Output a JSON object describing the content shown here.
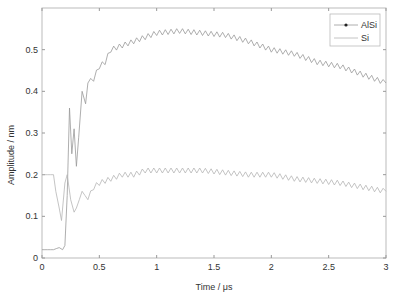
{
  "chart_data": {
    "type": "line",
    "title": "",
    "xlabel": "Time / μs",
    "ylabel": "Amplitude / nm",
    "xlim": [
      0,
      3
    ],
    "ylim": [
      0,
      0.6
    ],
    "xticks": [
      "0",
      "0.5",
      "1",
      "1.5",
      "2",
      "2.5",
      "3"
    ],
    "yticks": [
      "0",
      "0.1",
      "0.2",
      "0.3",
      "0.4",
      "0.5"
    ],
    "grid": false,
    "legend_position": "upper right",
    "series": [
      {
        "name": "AlSi",
        "marker": "dot",
        "x": [
          0,
          0.05,
          0.1,
          0.15,
          0.18,
          0.2,
          0.22,
          0.24,
          0.26,
          0.28,
          0.3,
          0.32,
          0.35,
          0.38,
          0.4,
          0.45,
          0.5,
          0.55,
          0.6,
          0.7,
          0.8,
          0.9,
          1.0,
          1.2,
          1.4,
          1.6,
          1.8,
          2.0,
          2.2,
          2.4,
          2.6,
          2.8,
          3.0
        ],
        "values": [
          0.02,
          0.02,
          0.02,
          0.025,
          0.02,
          0.03,
          0.15,
          0.36,
          0.25,
          0.31,
          0.22,
          0.29,
          0.4,
          0.37,
          0.42,
          0.43,
          0.46,
          0.47,
          0.5,
          0.51,
          0.52,
          0.53,
          0.54,
          0.545,
          0.54,
          0.535,
          0.52,
          0.5,
          0.49,
          0.47,
          0.46,
          0.44,
          0.42
        ]
      },
      {
        "name": "Si",
        "marker": "none",
        "x": [
          0,
          0.05,
          0.1,
          0.12,
          0.15,
          0.17,
          0.2,
          0.22,
          0.25,
          0.28,
          0.3,
          0.35,
          0.4,
          0.45,
          0.5,
          0.6,
          0.7,
          0.8,
          0.9,
          1.0,
          1.2,
          1.4,
          1.6,
          1.8,
          2.0,
          2.2,
          2.4,
          2.6,
          2.8,
          3.0
        ],
        "values": [
          0.2,
          0.2,
          0.2,
          0.16,
          0.12,
          0.09,
          0.18,
          0.2,
          0.14,
          0.11,
          0.12,
          0.16,
          0.14,
          0.17,
          0.18,
          0.19,
          0.2,
          0.2,
          0.21,
          0.21,
          0.21,
          0.21,
          0.205,
          0.2,
          0.2,
          0.19,
          0.185,
          0.18,
          0.17,
          0.16
        ]
      }
    ]
  }
}
